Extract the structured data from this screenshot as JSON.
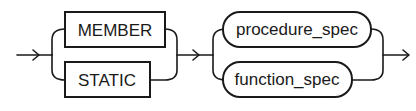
{
  "diagram": {
    "type": "railroad-syntax-diagram",
    "groups": [
      {
        "kind": "choice",
        "shape": "rectangle",
        "options": [
          {
            "label": "MEMBER"
          },
          {
            "label": "STATIC"
          }
        ]
      },
      {
        "kind": "choice",
        "shape": "rounded",
        "options": [
          {
            "label": "procedure_spec"
          },
          {
            "label": "function_spec"
          }
        ]
      }
    ],
    "colors": {
      "stroke": "#1a1a1a",
      "background": "#ffffff"
    }
  }
}
